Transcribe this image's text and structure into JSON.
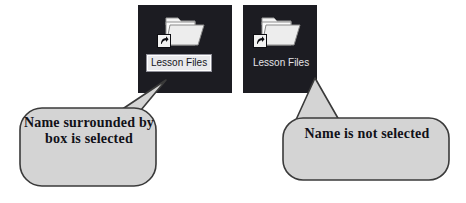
{
  "figure": {
    "background_color": "#ffffff",
    "width": 466,
    "height": 203
  },
  "panels": [
    {
      "id": "selected",
      "state": "selected",
      "background_color": "#1c1c22",
      "icon_name": "folder-shortcut-icon",
      "label": "Lesson Files",
      "label_has_selection_box": true,
      "label_text_color": "#15151a",
      "label_box_color": "#e9e9ec"
    },
    {
      "id": "unselected",
      "state": "not-selected",
      "background_color": "#1c1c22",
      "icon_name": "folder-shortcut-icon",
      "label": "Lesson Files",
      "label_has_selection_box": false,
      "label_text_color": "#e4e4e8",
      "label_box_color": "none"
    }
  ],
  "callouts": [
    {
      "id": "selected",
      "text": "Name surrounded by box is selected",
      "fill_color": "#d4d4d4",
      "border_color": "#3a3a3a",
      "points_to": "panel-selected"
    },
    {
      "id": "unselected",
      "text": "Name is not selected",
      "fill_color": "#d4d4d4",
      "border_color": "#3a3a3a",
      "points_to": "panel-unselected"
    }
  ]
}
